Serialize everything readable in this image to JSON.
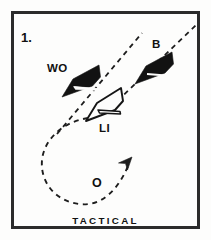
{
  "figure": {
    "index_label": "1.",
    "caption": "TACTICAL",
    "background_color": "#fdfdfc",
    "frame_color": "#2b2b2b",
    "ink_color": "#121212"
  },
  "ships": [
    {
      "id": "wo",
      "label": "WO",
      "style": "filled-dark",
      "heading": "up-right",
      "position": {
        "x": 82,
        "y": 80
      },
      "label_position": {
        "x": 47,
        "y": 72
      }
    },
    {
      "id": "b",
      "label": "B",
      "style": "filled-dark",
      "heading": "up-right",
      "position": {
        "x": 155,
        "y": 65
      },
      "label_position": {
        "x": 152,
        "y": 48
      }
    },
    {
      "id": "li",
      "label": "LI",
      "style": "outline-light",
      "heading": "up-right",
      "position": {
        "x": 106,
        "y": 103
      },
      "label_position": {
        "x": 99,
        "y": 129
      }
    }
  ],
  "markers": [
    {
      "id": "o",
      "label": "O",
      "position": {
        "x": 97,
        "y": 183
      }
    }
  ],
  "tracks": [
    {
      "id": "track-wo",
      "style": "dashed",
      "description": "dashed course line through WO toward upper right"
    },
    {
      "id": "track-b",
      "style": "dashed",
      "description": "dashed course line through B toward upper right"
    },
    {
      "id": "loop-o",
      "style": "dashed",
      "description": "dashed teardrop loop from LI around lower left ending in arrow at O"
    }
  ],
  "arrow": {
    "id": "loop-arrow",
    "direction": "up-right",
    "tip": {
      "x": 131,
      "y": 160
    }
  }
}
